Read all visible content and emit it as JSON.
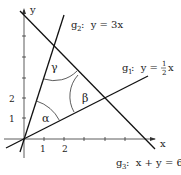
{
  "diagram": {
    "axes": {
      "x_label": "x",
      "y_label": "y",
      "x_ticks": [
        "1",
        "2"
      ],
      "y_ticks": [
        "1",
        "2"
      ]
    },
    "lines": [
      {
        "id": "g1",
        "name": "g",
        "sub": "1",
        "equation_prefix": ":  y =",
        "frac_num": "1",
        "frac_den": "2",
        "equation_suffix": "x"
      },
      {
        "id": "g2",
        "name": "g",
        "sub": "2",
        "equation": ":  y = 3x"
      },
      {
        "id": "g3",
        "name": "g",
        "sub": "3",
        "equation": ":  x + y = 6"
      }
    ],
    "angles": {
      "alpha": "α",
      "beta": "β",
      "gamma": "γ"
    },
    "colors": {
      "stroke": "#1a1a1a",
      "background": "#ffffff"
    }
  }
}
